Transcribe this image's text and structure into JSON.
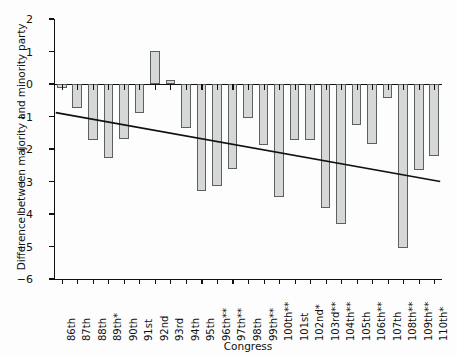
{
  "chart_data": {
    "type": "bar",
    "title": "",
    "xlabel": "Congress",
    "ylabel": "Difference between majority and minority party",
    "ylim": [
      -6,
      2
    ],
    "yticks": [
      2,
      1,
      0,
      -1,
      -2,
      -3,
      -4,
      -5,
      -6
    ],
    "ytick_labels": [
      "2",
      "1",
      "0",
      "−1",
      "−2",
      "−3",
      "−4",
      "−5",
      "−6"
    ],
    "grid": false,
    "legend": "none",
    "categories": [
      "86th",
      "87th",
      "88th",
      "89th*",
      "90th",
      "91st",
      "92nd",
      "93rd",
      "94th",
      "95th",
      "96th**",
      "97th**",
      "98th",
      "99th**",
      "100th**",
      "101st",
      "102nd*",
      "103rd**",
      "104th**",
      "105th",
      "106th**",
      "107th",
      "108th**",
      "109th**",
      "110th*"
    ],
    "values": [
      -0.12,
      -0.75,
      -1.72,
      -2.28,
      -1.7,
      -0.9,
      1.02,
      0.12,
      -1.35,
      -3.28,
      -3.15,
      -2.6,
      -1.05,
      -1.88,
      -3.48,
      -1.72,
      -1.73,
      -3.8,
      -4.3,
      -1.27,
      -1.85,
      -0.42,
      -5.05,
      -2.65,
      -2.2
    ],
    "series": [
      {
        "name": "Difference between majority and minority party",
        "values": [
          -0.12,
          -0.75,
          -1.72,
          -2.28,
          -1.7,
          -0.9,
          1.02,
          0.12,
          -1.35,
          -3.28,
          -3.15,
          -2.6,
          -1.05,
          -1.88,
          -3.48,
          -1.72,
          -1.73,
          -3.8,
          -4.3,
          -1.27,
          -1.85,
          -0.42,
          -5.05,
          -2.65,
          -2.2
        ]
      }
    ],
    "trendline": {
      "type": "linear",
      "start": {
        "category": "86th",
        "value": -0.88
      },
      "end": {
        "category": "110th*",
        "value": -3.0
      }
    },
    "colors": {
      "bar_fill": "#d6d8d8",
      "bar_edge": "#5d6063",
      "axis": "#111111",
      "trendline": "#111111"
    }
  }
}
